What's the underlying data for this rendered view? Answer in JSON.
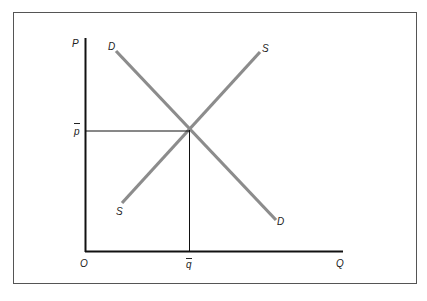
{
  "diagram": {
    "title": "",
    "type": "supply-demand",
    "colors": {
      "frame": "#555555",
      "axes": "#111111",
      "curves": "#8c8c8c",
      "guides": "#111111",
      "text": "#222222"
    },
    "axes": {
      "y_label": "P",
      "x_label": "Q",
      "origin_label": "O"
    },
    "curves": {
      "demand": {
        "start_label": "D",
        "end_label": "D"
      },
      "supply": {
        "start_label": "S",
        "end_label": "S"
      }
    },
    "equilibrium": {
      "price_label": "p",
      "quantity_label": "q"
    }
  }
}
